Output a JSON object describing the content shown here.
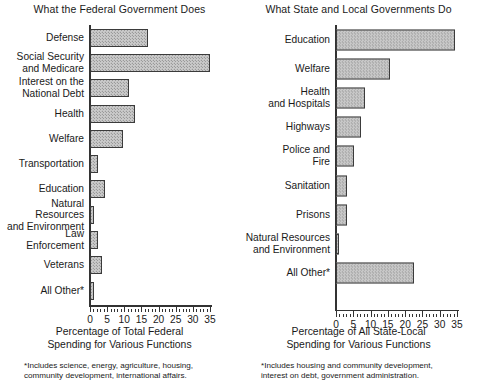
{
  "chart_data": [
    {
      "type": "bar",
      "orientation": "horizontal",
      "title": "What the Federal Government Does",
      "xlabel": "Percentage of Total Federal\nSpending for Various Functions",
      "ylabel": "",
      "xlim": [
        0,
        35
      ],
      "grid": false,
      "legend": false,
      "tick_labels": [
        "0",
        "5",
        "10",
        "15",
        "20",
        "25",
        "30",
        "35"
      ],
      "tick_values": [
        0,
        5,
        10,
        15,
        20,
        25,
        30,
        35
      ],
      "minor_tick_step": 1,
      "categories": [
        "Defense",
        "Social Security\nand Medicare",
        "Interest on the\nNational Debt",
        "Health",
        "Welfare",
        "Transportation",
        "Education",
        "Natural Resources\nand Environment",
        "Law\nEnforcement",
        "Veterans",
        "All Other*"
      ],
      "values": [
        17,
        35,
        11.5,
        13,
        9.5,
        2.2,
        4.5,
        1.2,
        2.4,
        3.4,
        1.2
      ],
      "footnote": "*Includes science, energy, agriculture, housing,\ncommunity development, international affairs."
    },
    {
      "type": "bar",
      "orientation": "horizontal",
      "title": "What State and Local Governments Do",
      "xlabel": "Percentage of All State-Local\nSpending for Various Functions",
      "ylabel": "",
      "xlim": [
        0,
        35
      ],
      "grid": false,
      "legend": false,
      "tick_labels": [
        "0",
        "5",
        "10",
        "15",
        "20",
        "25",
        "30",
        "35"
      ],
      "tick_values": [
        0,
        5,
        10,
        15,
        20,
        25,
        30,
        35
      ],
      "minor_tick_step": 1,
      "categories": [
        "Education",
        "Welfare",
        "Health\nand Hospitals",
        "Highways",
        "Police and\nFire",
        "Sanitation",
        "Prisons",
        "Natural Resources\nand Environment",
        "All Other*"
      ],
      "values": [
        34.5,
        15.5,
        8.3,
        7.3,
        5.2,
        3.3,
        3.3,
        0.9,
        22.5
      ],
      "footnote": "*Includes housing and community development,\ninterest on debt, government administration."
    }
  ],
  "left": {
    "title": "What the Federal Government Does",
    "axis_caption": "Percentage of Total Federal\nSpending for Various Functions",
    "footnote": "*Includes science, energy, agriculture, housing,\ncommunity development, international affairs.",
    "ticks": [
      "0",
      "5",
      "10",
      "15",
      "20",
      "25",
      "30",
      "35"
    ],
    "rows": [
      {
        "label": "Defense",
        "value": 17
      },
      {
        "label": "Social Security\nand Medicare",
        "value": 35
      },
      {
        "label": "Interest on the\nNational Debt",
        "value": 11.5
      },
      {
        "label": "Health",
        "value": 13
      },
      {
        "label": "Welfare",
        "value": 9.5
      },
      {
        "label": "Transportation",
        "value": 2.2
      },
      {
        "label": "Education",
        "value": 4.5
      },
      {
        "label": "Natural Resources\nand Environment",
        "value": 1.2
      },
      {
        "label": "Law\nEnforcement",
        "value": 2.4
      },
      {
        "label": "Veterans",
        "value": 3.4
      },
      {
        "label": "All Other*",
        "value": 1.2
      }
    ]
  },
  "right": {
    "title": "What State and Local Governments Do",
    "axis_caption": "Percentage of All State-Local\nSpending for Various Functions",
    "footnote": "*Includes housing and community development,\ninterest on debt, government administration.",
    "ticks": [
      "0",
      "5",
      "10",
      "15",
      "20",
      "25",
      "30",
      "35"
    ],
    "rows": [
      {
        "label": "Education",
        "value": 34.5
      },
      {
        "label": "Welfare",
        "value": 15.5
      },
      {
        "label": "Health\nand Hospitals",
        "value": 8.3
      },
      {
        "label": "Highways",
        "value": 7.3
      },
      {
        "label": "Police and\nFire",
        "value": 5.2
      },
      {
        "label": "Sanitation",
        "value": 3.3
      },
      {
        "label": "Prisons",
        "value": 3.3
      },
      {
        "label": "Natural Resources\nand Environment",
        "value": 0.9
      },
      {
        "label": "All Other*",
        "value": 22.5
      }
    ]
  },
  "colors": {
    "bar_fill": "#c9c9c9",
    "bar_stroke": "#3b3b3b",
    "axis": "#333333",
    "text": "#1a1a1a",
    "background": "#ffffff"
  }
}
